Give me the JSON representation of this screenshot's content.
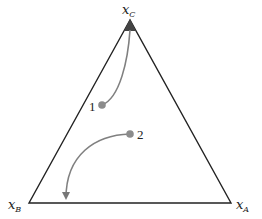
{
  "diagram": {
    "type": "ternary-composition-diagram",
    "vertices": [
      {
        "id": "C",
        "label_main": "x",
        "label_sub": "C",
        "position": "top"
      },
      {
        "id": "B",
        "label_main": "x",
        "label_sub": "B",
        "position": "bottom-left"
      },
      {
        "id": "A",
        "label_main": "x",
        "label_sub": "A",
        "position": "bottom-right"
      }
    ],
    "points": [
      {
        "label": "1",
        "path_target": "vertex C"
      },
      {
        "label": "2",
        "path_target": "edge B-A"
      }
    ],
    "colors": {
      "triangle": "#222222",
      "path": "#808080",
      "point": "#8c8c8c"
    }
  }
}
